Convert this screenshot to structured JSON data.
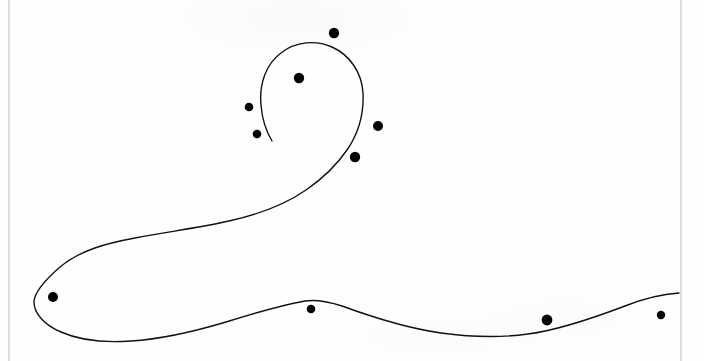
{
  "figure": {
    "width": 704,
    "height": 361,
    "background_color": "#fefefe",
    "ink_color": "#111111",
    "border_color": "#b9b9b9",
    "stroke_width": 1.4,
    "point_color": "#000000",
    "caption": ""
  },
  "borders": [
    {
      "name": "left-rule",
      "x1": 9,
      "y1": 0,
      "x2": 9,
      "y2": 361
    },
    {
      "name": "right-rule",
      "x1": 681,
      "y1": 0,
      "x2": 681,
      "y2": 361
    }
  ],
  "curve": {
    "name": "spiral-stroke",
    "description": "open spiral: inner tail near (272,140) winds counter-clockwise around a head centred near (318,105), sweeps down-left into a hairpin loop at the left edge, then runs right along the bottom and exits the right edge",
    "path": "M 272 141 C 266 131 262 118 261 105 C 259 84 266 64 281 53 C 296 41 316 40 332 47 C 350 55 362 73 363 93 C 364 114 358 134 347 150 C 336 166 322 179 306 190 C 283 206 256 215 229 221 C 198 228 166 232 135 238 C 108 243 80 250 60 267 C 44 281 34 293 34 302 C 34 313 44 325 61 332 C 79 340 104 343 131 341 C 163 339 196 331 226 322 C 255 313 282 305 305 301 C 318 299 330 302 342 306 C 372 317 406 328 441 333 C 470 337 500 338 528 334 C 560 330 596 317 625 306 C 645 298 664 294 679 293"
  },
  "points": [
    {
      "name": "point-1",
      "cx": 334,
      "cy": 33,
      "r": 5.2
    },
    {
      "name": "point-2",
      "cx": 299,
      "cy": 78,
      "r": 5.2
    },
    {
      "name": "point-3",
      "cx": 249,
      "cy": 107,
      "r": 4.3
    },
    {
      "name": "point-4",
      "cx": 257,
      "cy": 134,
      "r": 4.3
    },
    {
      "name": "point-5",
      "cx": 378,
      "cy": 126,
      "r": 5.0
    },
    {
      "name": "point-6",
      "cx": 355,
      "cy": 157,
      "r": 5.2
    },
    {
      "name": "point-7",
      "cx": 53,
      "cy": 297,
      "r": 5.0
    },
    {
      "name": "point-8",
      "cx": 311,
      "cy": 309,
      "r": 4.3
    },
    {
      "name": "point-9",
      "cx": 547,
      "cy": 320,
      "r": 5.4
    },
    {
      "name": "point-10",
      "cx": 661,
      "cy": 315,
      "r": 4.2
    }
  ]
}
